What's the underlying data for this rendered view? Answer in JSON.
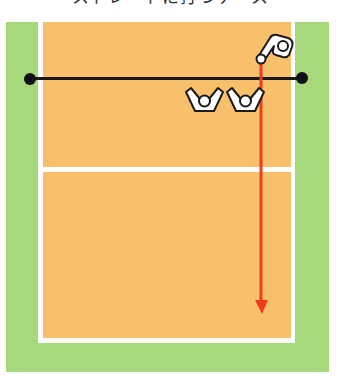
{
  "title": "ストレートに打つケース",
  "colors": {
    "outer_area": "#a6d97c",
    "court": "#f8c06a",
    "court_lines": "#ffffff",
    "net": "#1a1a1a",
    "attack_arrow": "#ee3b1e",
    "player_fill": "#ffffff",
    "player_outline": "#1a1a1a"
  },
  "diagram": {
    "elements": [
      {
        "name": "net",
        "description": "black net line with posts at both ends"
      },
      {
        "name": "attack-line",
        "description": "white line across court mid section"
      },
      {
        "name": "hitter",
        "description": "attacker figure hitting ball near right antenna"
      },
      {
        "name": "blocker-1",
        "description": "blocker with arms raised"
      },
      {
        "name": "blocker-2",
        "description": "blocker with arms raised"
      },
      {
        "name": "attack-arrow",
        "description": "red arrow showing straight spike path down the line"
      }
    ]
  }
}
